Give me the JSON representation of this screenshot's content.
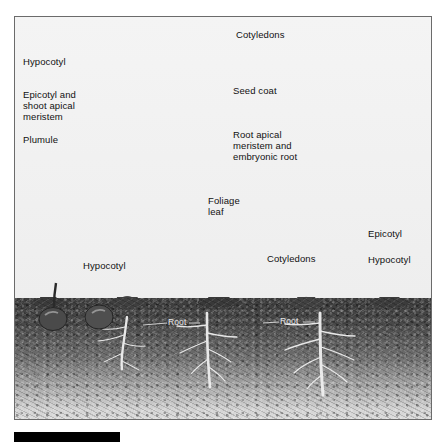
{
  "figure": {
    "type": "biology-diagram",
    "style": "grayscale halftone textbook illustration",
    "frame": {
      "border_color": "#6b6b6b",
      "background_color": "#f2f2f2"
    }
  },
  "seed_diagram": {
    "title_visible": false,
    "description": "Enlarged cutaway bean seed split into two cotyledons",
    "labels": {
      "hypocotyl": "Hypocotyl",
      "epicotyl_shoot_apical_meristem": "Epicotyl and\nshoot apical\nmeristem",
      "plumule": "Plumule",
      "cotyledons": "Cotyledons",
      "seed_coat": "Seed coat",
      "root_apical_meristem": "Root apical\nmeristem and\nembryonic root"
    }
  },
  "germination_row": {
    "labels": {
      "foliage_leaf": "Foliage\nleaf",
      "hypocotyl_left": "Hypocotyl",
      "cotyledons_middle": "Cotyledons",
      "epicotyl_right": "Epicotyl",
      "hypocotyl_right": "Hypocotyl"
    },
    "soil_labels": {
      "root_left": "Root",
      "root_right": "Root"
    },
    "stages": [
      {
        "name": "buried-seed",
        "description": "Seed underground with emerging radicle"
      },
      {
        "name": "hypocotyl-arch",
        "description": "Hypocotyl hook pushing above soil"
      },
      {
        "name": "cotyledons-emerged",
        "description": "Cotyledons above ground, first leaves folded"
      },
      {
        "name": "mature-seedling",
        "description": "Expanded foliage leaves, cotyledons shrinking"
      }
    ]
  },
  "colors": {
    "ink": "#111111",
    "soil_dark": "#3b3b3b",
    "soil_light": "#dedede",
    "plant_gray": "#9a9a9a",
    "label_white": "#e8e8e8",
    "caption_bar": "#000000"
  }
}
